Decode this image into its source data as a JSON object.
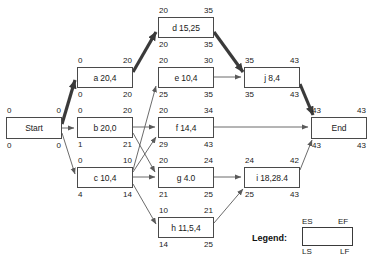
{
  "diagram": {
    "type": "cpm-network-diagram",
    "title": "",
    "nodes": [
      {
        "id": "start",
        "label": "Start",
        "es": "0",
        "ef": "0",
        "ls": "0",
        "lf": "0",
        "x": 6,
        "y": 117,
        "w": 56,
        "h": 22,
        "critical": true
      },
      {
        "id": "a",
        "label": "a 20,4",
        "es": "0",
        "ef": "20",
        "ls": "0",
        "lf": "20",
        "x": 77,
        "y": 67,
        "w": 56,
        "h": 21,
        "critical": true
      },
      {
        "id": "b",
        "label": "b 20,0",
        "es": "0",
        "ef": "20",
        "ls": "1",
        "lf": "21",
        "x": 77,
        "y": 117,
        "w": 56,
        "h": 21,
        "critical": false
      },
      {
        "id": "c",
        "label": "c 10,4",
        "es": "0",
        "ef": "10",
        "ls": "4",
        "lf": "14",
        "x": 77,
        "y": 167,
        "w": 56,
        "h": 21,
        "critical": false
      },
      {
        "id": "d",
        "label": "d 15,25",
        "es": "20",
        "ef": "35",
        "ls": "20",
        "lf": "35",
        "x": 158,
        "y": 17,
        "w": 56,
        "h": 21,
        "critical": true
      },
      {
        "id": "e",
        "label": "e 10,4",
        "es": "20",
        "ef": "30",
        "ls": "25",
        "lf": "35",
        "x": 158,
        "y": 67,
        "w": 56,
        "h": 21,
        "critical": false
      },
      {
        "id": "f",
        "label": "f 14,4",
        "es": "20",
        "ef": "34",
        "ls": "29",
        "lf": "43",
        "x": 158,
        "y": 117,
        "w": 56,
        "h": 21,
        "critical": false
      },
      {
        "id": "g",
        "label": "g 4.0",
        "es": "20",
        "ef": "24",
        "ls": "21",
        "lf": "25",
        "x": 158,
        "y": 167,
        "w": 56,
        "h": 21,
        "critical": false
      },
      {
        "id": "h",
        "label": "h 11,5,4",
        "es": "10",
        "ef": "21",
        "ls": "14",
        "lf": "25",
        "x": 158,
        "y": 217,
        "w": 56,
        "h": 21,
        "critical": false
      },
      {
        "id": "j",
        "label": "j 8,4",
        "es": "35",
        "ef": "43",
        "ls": "35",
        "lf": "43",
        "x": 244,
        "y": 67,
        "w": 56,
        "h": 21,
        "critical": true
      },
      {
        "id": "i",
        "label": "i 18,28.4",
        "es": "24",
        "ef": "42",
        "ls": "25",
        "lf": "43",
        "x": 244,
        "y": 167,
        "w": 56,
        "h": 21,
        "critical": false
      },
      {
        "id": "end",
        "label": "End",
        "es": "43",
        "ef": "43",
        "ls": "43",
        "lf": "43",
        "x": 311,
        "y": 117,
        "w": 56,
        "h": 22,
        "critical": true
      }
    ],
    "edges": [
      {
        "from": "start",
        "to": "a",
        "critical": true
      },
      {
        "from": "start",
        "to": "b",
        "critical": false
      },
      {
        "from": "start",
        "to": "c",
        "critical": false
      },
      {
        "from": "a",
        "to": "d",
        "critical": true
      },
      {
        "from": "b",
        "to": "f",
        "critical": false
      },
      {
        "from": "b",
        "to": "g",
        "critical": false
      },
      {
        "from": "c",
        "to": "e",
        "critical": false
      },
      {
        "from": "c",
        "to": "f",
        "critical": false
      },
      {
        "from": "c",
        "to": "g",
        "critical": false
      },
      {
        "from": "c",
        "to": "h",
        "critical": false
      },
      {
        "from": "d",
        "to": "j",
        "critical": true
      },
      {
        "from": "e",
        "to": "j",
        "critical": false
      },
      {
        "from": "f",
        "to": "end",
        "critical": false
      },
      {
        "from": "g",
        "to": "i",
        "critical": false
      },
      {
        "from": "h",
        "to": "i",
        "critical": false
      },
      {
        "from": "i",
        "to": "end",
        "critical": false
      },
      {
        "from": "j",
        "to": "end",
        "critical": true
      }
    ],
    "colors": {
      "node_border": "#4a4a4a",
      "edge": "#5a5a5a",
      "critical_edge": "#3a3a3a",
      "text": "#1a1a1a",
      "background": "#ffffff"
    }
  },
  "legend": {
    "title": "Legend:",
    "es": "ES",
    "ef": "EF",
    "ls": "LS",
    "lf": "LF"
  }
}
